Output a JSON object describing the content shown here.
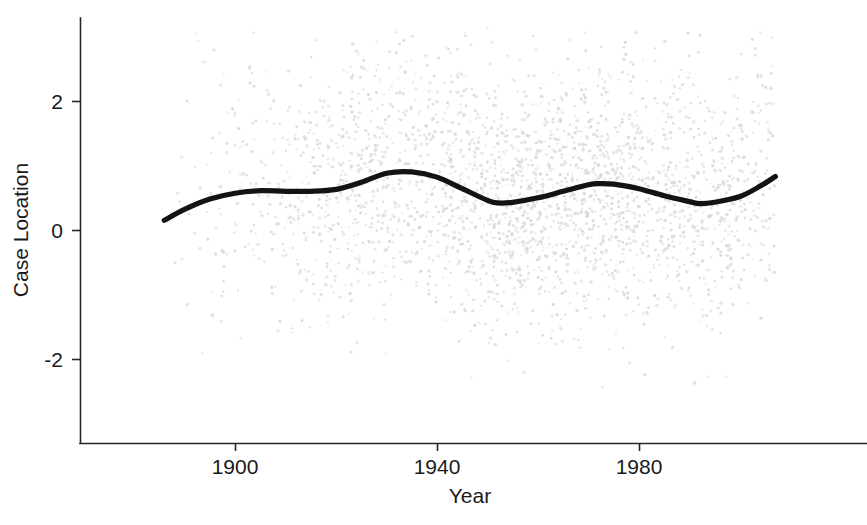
{
  "chart_data": {
    "type": "scatter",
    "title": "",
    "subtitle": "",
    "xlabel": "Year",
    "ylabel": "Case Location",
    "xlim": [
      1884,
      2008
    ],
    "ylim": [
      -3.3,
      3.2
    ],
    "xticks": [
      1900,
      1940,
      1980
    ],
    "xticklabels": [
      "1900",
      "1940",
      "1980"
    ],
    "yticks": [
      -2,
      0,
      2
    ],
    "yticklabels": [
      "-2",
      "0",
      "2"
    ],
    "grid": false,
    "legend": "none",
    "series": [
      {
        "name": "Case Location observations",
        "type": "scatter",
        "marker_color": "#d9d9d9",
        "marker_size": 2,
        "n_points": 3400,
        "note": "dense light-grey point cloud spanning roughly 1886-2007 on x and -3.2 to 3.1 on y, densest between -1 and 2 in the 1930-1980 period"
      },
      {
        "name": "LOESS smooth",
        "type": "line",
        "line_color": "#131313",
        "line_width": 5,
        "x": [
          1886,
          1890,
          1895,
          1900,
          1905,
          1910,
          1915,
          1920,
          1925,
          1930,
          1935,
          1940,
          1945,
          1950,
          1952,
          1955,
          1960,
          1965,
          1970,
          1972,
          1975,
          1980,
          1985,
          1990,
          1992,
          1995,
          2000,
          2004,
          2007
        ],
        "values": [
          0.15,
          0.32,
          0.48,
          0.57,
          0.61,
          0.6,
          0.6,
          0.63,
          0.74,
          0.88,
          0.9,
          0.82,
          0.64,
          0.46,
          0.42,
          0.43,
          0.5,
          0.6,
          0.7,
          0.72,
          0.71,
          0.64,
          0.53,
          0.44,
          0.41,
          0.43,
          0.52,
          0.68,
          0.83
        ]
      }
    ]
  },
  "axes": {
    "x_axis_label": "Year",
    "y_axis_label": "Case Location"
  }
}
